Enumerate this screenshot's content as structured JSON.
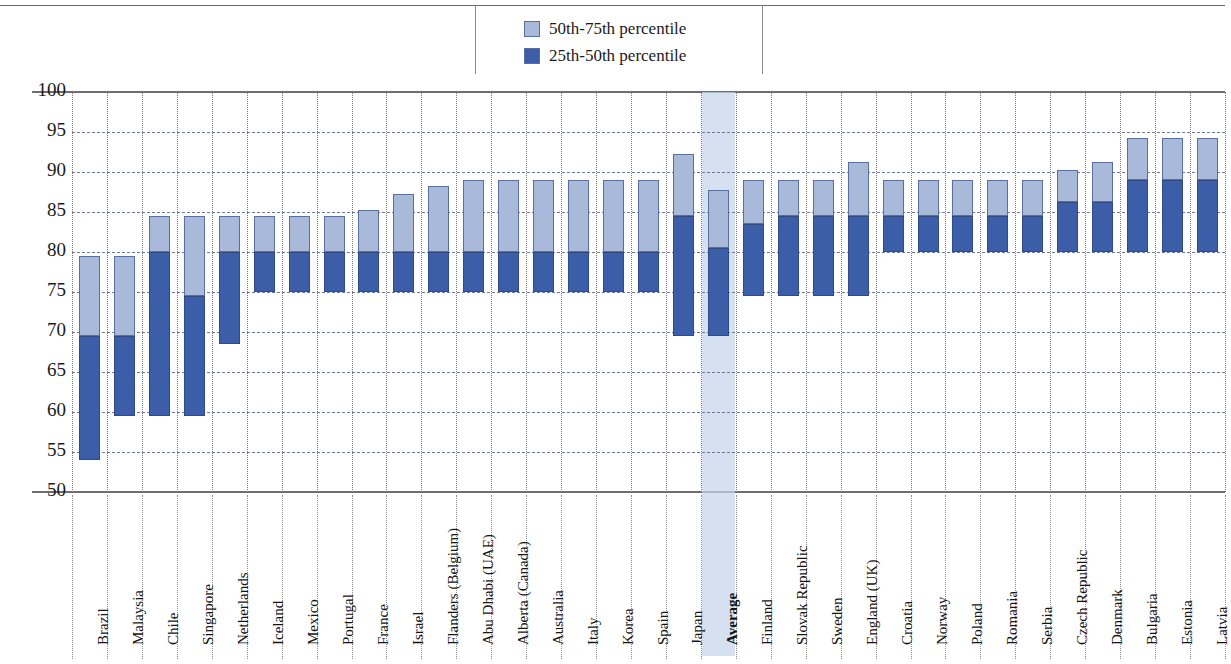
{
  "legend": {
    "entries": [
      {
        "label": "50th-75th percentile",
        "color": "#a9b9da",
        "name": "legend-swatch-upper"
      },
      {
        "label": "25th-50th percentile",
        "color": "#3c5da7",
        "name": "legend-swatch-lower"
      }
    ]
  },
  "colors": {
    "upper_band": "#a9b9da",
    "lower_band": "#3c5da7",
    "band_border": "#596f9f",
    "average_highlight": "#c5d6ec",
    "gridline": "#6e7a93",
    "axis": "#6e6e6e"
  },
  "chart_data": {
    "type": "bar",
    "title": "",
    "subtitle": "",
    "xlabel": "",
    "ylabel": "Percentage of class time spent on teaching and learning",
    "ylim": [
      50,
      100
    ],
    "yticks": [
      50,
      55,
      60,
      65,
      70,
      75,
      80,
      85,
      90,
      95,
      100
    ],
    "grid": true,
    "legend_position": "top-center",
    "note": "Floating stacked bars: bottom = 25th percentile, split = 50th percentile (median), top = 75th percentile",
    "highlighted_category": "Average",
    "series": [
      {
        "name": "25th-50th percentile",
        "color": "#3c5da7"
      },
      {
        "name": "50th-75th percentile",
        "color": "#a9b9da"
      }
    ],
    "categories": [
      "Brazil",
      "Malaysia",
      "Chile",
      "Singapore",
      "Netherlands",
      "Iceland",
      "Mexico",
      "Portugal",
      "France",
      "Israel",
      "Flanders (Belgium)",
      "Abu Dhabi (UAE)",
      "Alberta (Canada)",
      "Australia",
      "Italy",
      "Korea",
      "Spain",
      "Japan",
      "Average",
      "Finland",
      "Slovak Republic",
      "Sweden",
      "England (UK)",
      "Croatia",
      "Norway",
      "Poland",
      "Romania",
      "Serbia",
      "Czech Republic",
      "Denmark",
      "Bulgaria",
      "Estonia",
      "Latvia"
    ],
    "p25": [
      54.0,
      59.5,
      59.5,
      59.5,
      68.5,
      75.0,
      75.0,
      75.0,
      75.0,
      75.0,
      75.0,
      75.0,
      75.0,
      75.0,
      75.0,
      75.0,
      75.0,
      69.5,
      69.5,
      74.5,
      74.5,
      74.5,
      74.5,
      80.0,
      80.0,
      80.0,
      80.0,
      80.0,
      80.0,
      80.0,
      80.0,
      80.0,
      80.0
    ],
    "p50": [
      69.5,
      69.5,
      80.0,
      74.5,
      80.0,
      80.0,
      80.0,
      80.0,
      80.0,
      80.0,
      80.0,
      80.0,
      80.0,
      80.0,
      80.0,
      80.0,
      80.0,
      84.5,
      80.5,
      83.5,
      84.5,
      84.5,
      84.5,
      84.5,
      84.5,
      84.5,
      84.5,
      84.5,
      86.3,
      86.3,
      89.0,
      89.0,
      89.0
    ],
    "p75": [
      79.5,
      79.5,
      84.5,
      84.5,
      84.5,
      84.5,
      84.5,
      84.5,
      85.3,
      87.3,
      88.3,
      89.0,
      89.0,
      89.0,
      89.0,
      89.0,
      89.0,
      92.3,
      87.8,
      89.0,
      89.0,
      89.0,
      91.3,
      89.0,
      89.0,
      89.0,
      89.0,
      89.0,
      90.3,
      91.3,
      94.3,
      94.3,
      94.3
    ]
  }
}
